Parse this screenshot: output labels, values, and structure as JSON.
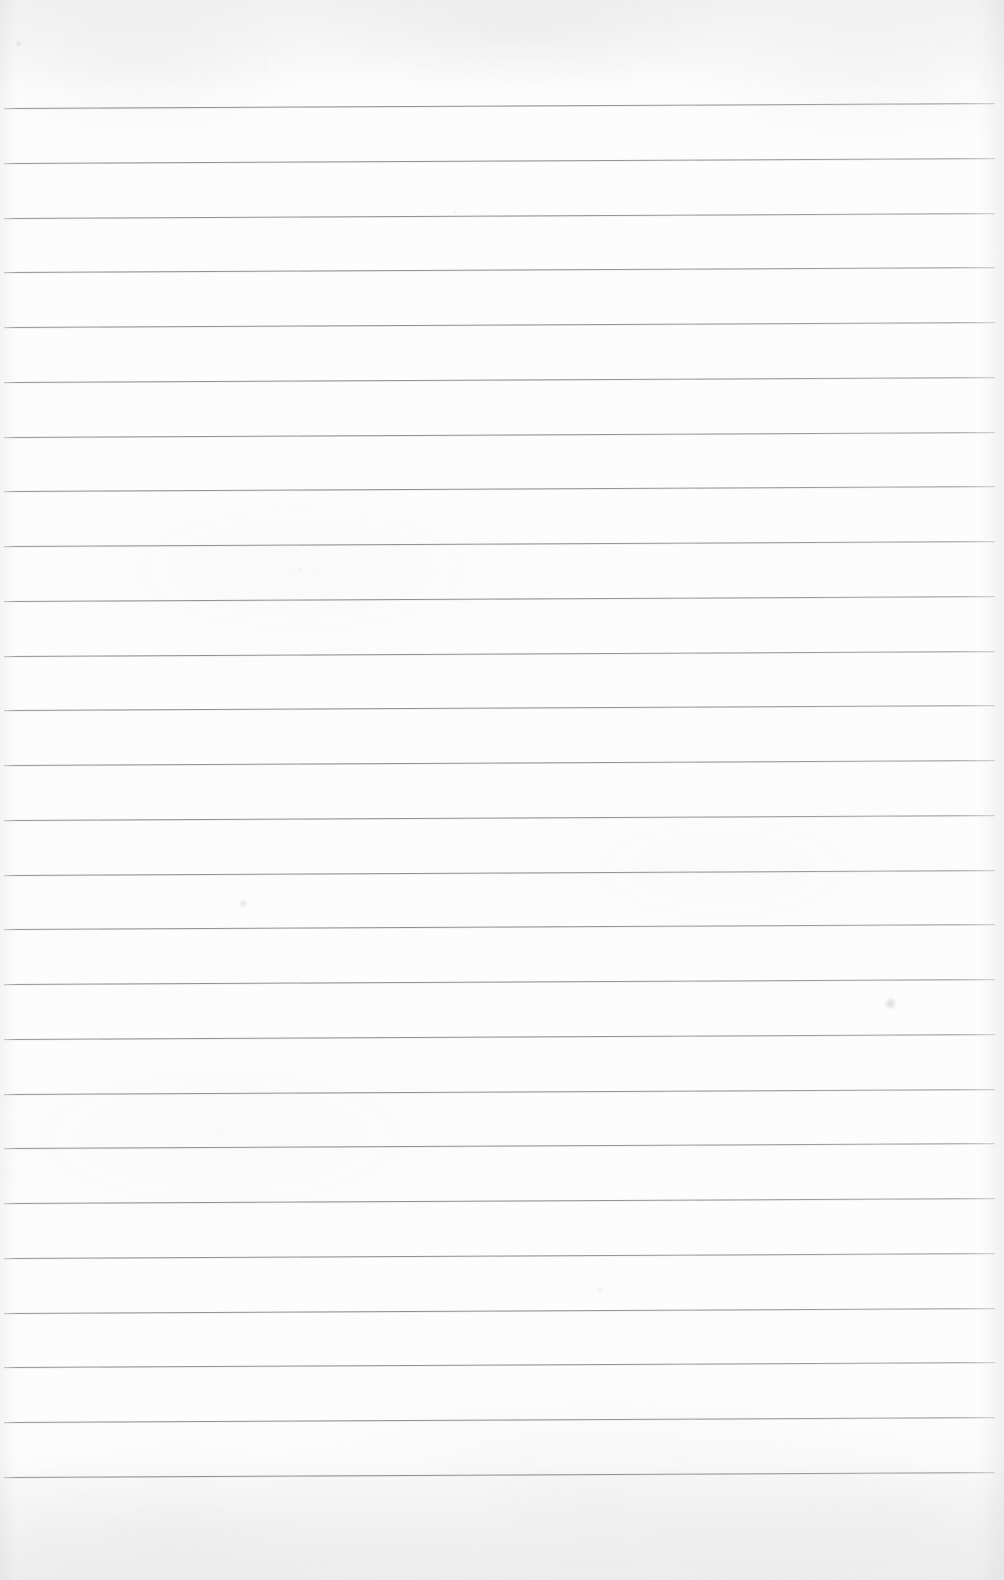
{
  "document": {
    "kind": "scanned-page",
    "subject": "blank ruled notebook paper",
    "title": "Scanned Lined Notebook Page",
    "page_width": 1004,
    "page_height": 1580,
    "text_content": "",
    "handwriting_present": "no",
    "printed_text_present": "no"
  },
  "colors": {
    "paper": "#fdfdfd",
    "paper_shade": "#f2f3f4",
    "rule_line": "#8e9094",
    "rule_line_faded": "#a8aaae",
    "edge_shadow": "#9ea0a5",
    "speck": "#96989e"
  },
  "paper": {
    "background_label": "off-white scanned paper",
    "texture_label": "fine scan grain with soft mottling",
    "top_margin_label": "blank top margin",
    "bottom_margin_label": "blank bottom margin",
    "left_edge_label": "left page edge",
    "right_edge_label": "right page edge"
  },
  "ruling": {
    "line_count": 26,
    "first_line_y_left": 108,
    "line_spacing": 54.7,
    "line_start_x": 4,
    "line_end_x": 995,
    "line_thickness": 1,
    "skew_rise_px": 5,
    "skew_degrees": -0.29,
    "margin_rule": "none",
    "lines": [
      {
        "index": 1,
        "y_left": 108,
        "y_right": 103
      },
      {
        "index": 2,
        "y_left": 163,
        "y_right": 158
      },
      {
        "index": 3,
        "y_left": 218,
        "y_right": 213
      },
      {
        "index": 4,
        "y_left": 272,
        "y_right": 267
      },
      {
        "index": 5,
        "y_left": 327,
        "y_right": 322
      },
      {
        "index": 6,
        "y_left": 382,
        "y_right": 377
      },
      {
        "index": 7,
        "y_left": 437,
        "y_right": 432
      },
      {
        "index": 8,
        "y_left": 491,
        "y_right": 486
      },
      {
        "index": 9,
        "y_left": 546,
        "y_right": 541
      },
      {
        "index": 10,
        "y_left": 601,
        "y_right": 596
      },
      {
        "index": 11,
        "y_left": 656,
        "y_right": 651
      },
      {
        "index": 12,
        "y_left": 710,
        "y_right": 705
      },
      {
        "index": 13,
        "y_left": 765,
        "y_right": 760
      },
      {
        "index": 14,
        "y_left": 820,
        "y_right": 815
      },
      {
        "index": 15,
        "y_left": 875,
        "y_right": 870
      },
      {
        "index": 16,
        "y_left": 929,
        "y_right": 924
      },
      {
        "index": 17,
        "y_left": 984,
        "y_right": 979
      },
      {
        "index": 18,
        "y_left": 1039,
        "y_right": 1034
      },
      {
        "index": 19,
        "y_left": 1094,
        "y_right": 1089
      },
      {
        "index": 20,
        "y_left": 1148,
        "y_right": 1143
      },
      {
        "index": 21,
        "y_left": 1203,
        "y_right": 1198
      },
      {
        "index": 22,
        "y_left": 1258,
        "y_right": 1253
      },
      {
        "index": 23,
        "y_left": 1313,
        "y_right": 1308
      },
      {
        "index": 24,
        "y_left": 1367,
        "y_right": 1362
      },
      {
        "index": 25,
        "y_left": 1422,
        "y_right": 1417
      },
      {
        "index": 26,
        "y_left": 1477,
        "y_right": 1472
      }
    ]
  },
  "marks": [
    {
      "name": "speck-top-left",
      "x": 18,
      "y": 43,
      "size": 7,
      "strength": "faint"
    },
    {
      "name": "speck-mid-left",
      "x": 243,
      "y": 903,
      "size": 9,
      "strength": "faint"
    },
    {
      "name": "smudge-upper-right",
      "x": 890,
      "y": 1003,
      "size": 13,
      "strength": "faint"
    },
    {
      "name": "speck-upper-mid",
      "x": 455,
      "y": 212,
      "size": 6,
      "strength": "very-faint"
    },
    {
      "name": "speck-lower-mid",
      "x": 300,
      "y": 570,
      "size": 6,
      "strength": "very-faint"
    },
    {
      "name": "speck-center",
      "x": 600,
      "y": 1290,
      "size": 8,
      "strength": "very-faint"
    }
  ]
}
